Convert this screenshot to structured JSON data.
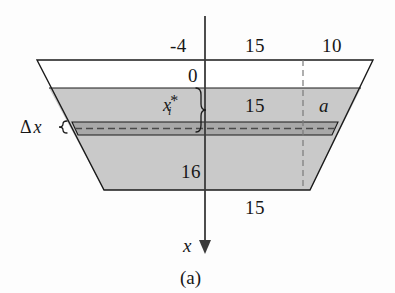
{
  "figure": {
    "caption": "(a)",
    "axis": {
      "variable_label": "x",
      "direction": "down",
      "arrow_icon": "down-arrow-icon",
      "origin_label": "0"
    },
    "dimensions": {
      "depth_above_water": "-4",
      "top_half_width": "15",
      "top_overhang": "10",
      "water_surface": "0",
      "mid_half_width": "15",
      "side_offset_label": "a",
      "bottom_depth": "16",
      "bottom_half_width": "15"
    },
    "annotations": {
      "sample_point": "x",
      "sample_point_sub": "i",
      "sample_point_star": "*",
      "strip_thickness_delta": "Δ",
      "strip_thickness_var": "x"
    },
    "colors": {
      "fill_submerged": "#c9c9c9",
      "fill_strip": "#a8a8a8",
      "fill_air": "#ffffff",
      "outline": "#1a1a1a",
      "dashed": "#6e6e6e",
      "axis": "#3a3a3a",
      "background": "#fdfdfd"
    }
  }
}
